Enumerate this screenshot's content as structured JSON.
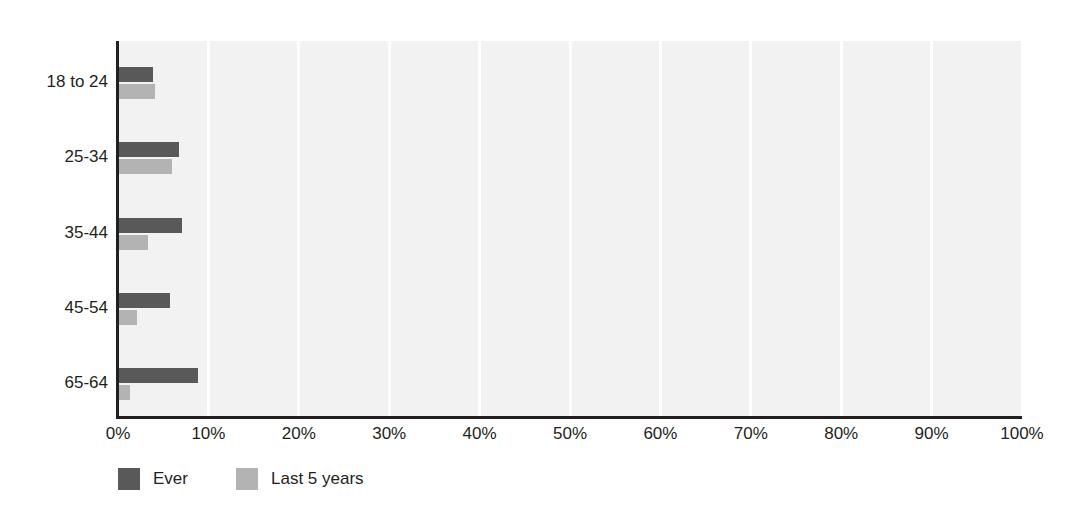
{
  "chart_data": {
    "type": "bar",
    "orientation": "horizontal",
    "title": "",
    "subtitle": "",
    "xlabel": "",
    "ylabel": "",
    "xlim": [
      0,
      100
    ],
    "ylim": null,
    "grid": true,
    "grid_axis": "x",
    "legend_position": "bottom-left",
    "categories": [
      "18 to 24",
      "25-34",
      "35-44",
      "45-54",
      "65-64"
    ],
    "xtick_labels": [
      "0%",
      "10%",
      "20%",
      "30%",
      "40%",
      "50%",
      "60%",
      "70%",
      "80%",
      "90%",
      "100%"
    ],
    "xtick_values": [
      0,
      10,
      20,
      30,
      40,
      50,
      60,
      70,
      80,
      90,
      100
    ],
    "series": [
      {
        "name": "Ever",
        "color": "#595959",
        "values": [
          3.9,
          6.7,
          7.1,
          5.7,
          8.8
        ]
      },
      {
        "name": "Last 5 years",
        "color": "#b3b3b3",
        "values": [
          4.1,
          6.0,
          3.3,
          2.1,
          1.3
        ]
      }
    ]
  },
  "legend": {
    "items": [
      {
        "label": "Ever",
        "color": "#595959"
      },
      {
        "label": "Last 5 years",
        "color": "#b3b3b3"
      }
    ]
  },
  "colors": {
    "plot_background": "#f2f2f2",
    "gridline": "#ffffff",
    "axis": "#231f20",
    "text": "#231f20",
    "series_ever": "#595959",
    "series_last5": "#b3b3b3"
  }
}
